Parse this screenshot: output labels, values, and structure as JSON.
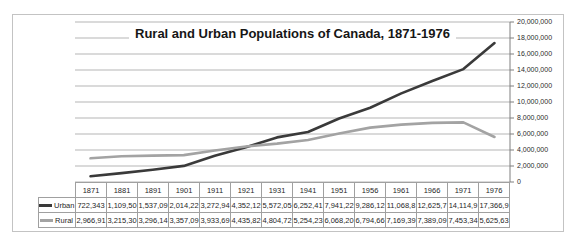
{
  "chart_data": {
    "type": "line",
    "title": "Rural and Urban Populations of Canada, 1871-1976",
    "categories": [
      "1871",
      "1881",
      "1891",
      "1901",
      "1911",
      "1921",
      "1931",
      "1941",
      "1951",
      "1956",
      "1961",
      "1966",
      "1971",
      "1976"
    ],
    "series": [
      {
        "name": "Urban",
        "color": "#3a3a3a",
        "values": [
          722343,
          1109500,
          1537090,
          2014220,
          3272940,
          4352120,
          5572050,
          6252410,
          7941220,
          9286120,
          11068800,
          12625700,
          14114900,
          17366900
        ]
      },
      {
        "name": "Rural",
        "color": "#a3a3a3",
        "values": [
          2966910,
          3215300,
          3296140,
          3357090,
          3933690,
          4435820,
          4804720,
          5254230,
          6068200,
          6794660,
          7169390,
          7389090,
          7453340,
          5625630
        ]
      }
    ],
    "xlabel": "",
    "ylabel": "",
    "ylim": [
      0,
      20000000
    ],
    "ytick_step": 2000000,
    "ytick_labels_top_to_bottom": [
      "20,000,000",
      "18,000,000",
      "16,000,000",
      "14,000,000",
      "12,000,000",
      "10,000,000",
      "8,000,000",
      "6,000,000",
      "4,000,000",
      "2,000,000",
      "0"
    ],
    "grid": true,
    "gridline_color": "#b5b5b5",
    "axis_color": "#7f7f7f",
    "legend_position": "attached-data-table-left"
  },
  "data_table": {
    "years": [
      "1871",
      "1881",
      "1891",
      "1901",
      "1911",
      "1921",
      "1931",
      "1941",
      "1951",
      "1956",
      "1961",
      "1966",
      "1971",
      "1976"
    ],
    "rows": [
      {
        "label": "Urban",
        "swatch_color": "#3a3a3a",
        "cells": [
          "722,343",
          "1,109,50",
          "1,537,09",
          "2,014,22",
          "3,272,94",
          "4,352,12",
          "5,572,05",
          "6,252,41",
          "7,941,22",
          "9,286,12",
          "11,068,8",
          "12,625,7",
          "14,114,9",
          "17,366,9"
        ]
      },
      {
        "label": "Rural",
        "swatch_color": "#a3a3a3",
        "cells": [
          "2,966,91",
          "3,215,30",
          "3,296,14",
          "3,357,09",
          "3,933,69",
          "4,435,82",
          "4,804,72",
          "5,254,23",
          "6,068,20",
          "6,794,66",
          "7,169,39",
          "7,389,09",
          "7,453,34",
          "5,625,63"
        ]
      }
    ]
  },
  "colors": {
    "frame_border": "#c3c3c3",
    "background": "#ffffff",
    "table_border": "#a0a0a0"
  }
}
